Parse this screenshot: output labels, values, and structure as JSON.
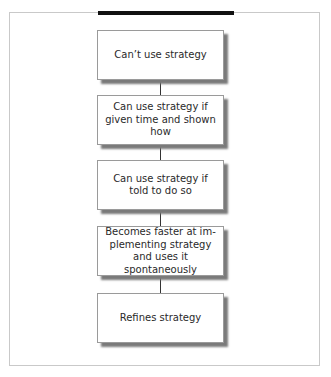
{
  "diagram": {
    "type": "vertical-flowchart",
    "steps": [
      {
        "label": "Can’t use strategy"
      },
      {
        "label": "Can use strategy if given time and shown how"
      },
      {
        "label": "Can use strategy if told to do so"
      },
      {
        "label": "Becomes faster at im-plementing strategy and uses it spontaneously"
      },
      {
        "label": "Refines strategy"
      }
    ]
  }
}
